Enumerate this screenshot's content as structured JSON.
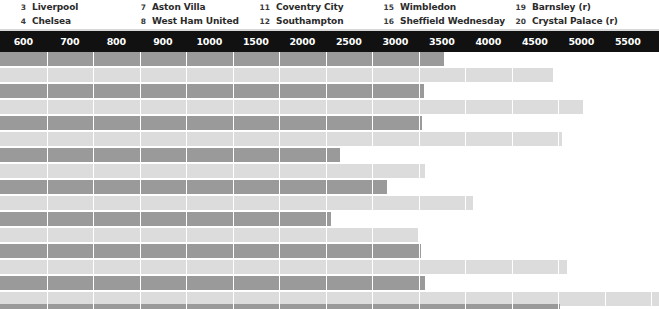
{
  "legend": {
    "columns": [
      {
        "left": 8,
        "entries": [
          {
            "num": "3",
            "name": "Liverpool"
          },
          {
            "num": "4",
            "name": "Chelsea"
          }
        ]
      },
      {
        "left": 128,
        "entries": [
          {
            "num": "7",
            "name": "Aston Villa"
          },
          {
            "num": "8",
            "name": "West Ham United"
          }
        ]
      },
      {
        "left": 252,
        "entries": [
          {
            "num": "11",
            "name": "Coventry City"
          },
          {
            "num": "12",
            "name": "Southampton"
          }
        ]
      },
      {
        "left": 376,
        "entries": [
          {
            "num": "15",
            "name": "Wimbledon"
          },
          {
            "num": "16",
            "name": "Sheffield Wednesday"
          }
        ]
      },
      {
        "left": 508,
        "entries": [
          {
            "num": "19",
            "name": "Barnsley (r)"
          },
          {
            "num": "20",
            "name": "Crystal Palace (r)"
          }
        ]
      }
    ]
  },
  "axis": {
    "ticks": [
      "600",
      "700",
      "800",
      "900",
      "1000",
      "1500",
      "2000",
      "2500",
      "3000",
      "3500",
      "4000",
      "4500",
      "5000",
      "5500",
      "6000",
      "6500",
      "7000"
    ],
    "tick_step_px": 46.5,
    "tick_origin_px": 0,
    "background_color": "#111111",
    "label_color": "#ffffff"
  },
  "colors": {
    "bar_dark": "#9a9a9a",
    "bar_light": "#dcdcdc",
    "gridline": "#ffffff",
    "page_background": "#ffffff",
    "legend_text": "#2b2b2b"
  },
  "chart_data": {
    "type": "bar",
    "orientation": "horizontal",
    "title": "",
    "xlabel": "",
    "ylabel": "",
    "grid": true,
    "legend_position": "top",
    "axis_tick_labels": [
      "600",
      "700",
      "800",
      "900",
      "1000",
      "1500",
      "2000",
      "2500",
      "3000",
      "3500",
      "4000",
      "4500",
      "5000",
      "5500",
      "6000",
      "6500",
      "7000"
    ],
    "axis_scale": "non-linear-banded",
    "series": [
      {
        "name": "dark",
        "color": "#9a9a9a"
      },
      {
        "name": "light",
        "color": "#dcdcdc"
      }
    ],
    "rows": [
      {
        "index": 1,
        "dark_px": 444,
        "light_px": 553,
        "dark_value": 4480,
        "light_value": 5870
      },
      {
        "index": 2,
        "dark_px": 424,
        "light_px": 583,
        "dark_value": 4270,
        "light_value": 6190
      },
      {
        "index": 3,
        "dark_px": 422,
        "light_px": 562,
        "dark_value": 4250,
        "light_value": 5970
      },
      {
        "index": 4,
        "dark_px": 340,
        "light_px": 425,
        "dark_value": 3370,
        "light_value": 4280
      },
      {
        "index": 5,
        "dark_px": 387,
        "light_px": 473,
        "dark_value": 3870,
        "light_value": 4790
      },
      {
        "index": 6,
        "dark_px": 331,
        "light_px": 418,
        "dark_value": 3280,
        "light_value": 4200
      },
      {
        "index": 7,
        "dark_px": 421,
        "light_px": 567,
        "dark_value": 4240,
        "light_value": 6020
      },
      {
        "index": 8,
        "dark_px": 425,
        "light_px": 659,
        "dark_value": 4280,
        "light_value": 7000
      },
      {
        "index": 9,
        "dark_px": 560,
        "light_px": 659,
        "dark_value": 5920,
        "light_value": 7000
      }
    ],
    "row_geometry": [
      {
        "top": 0,
        "dark_h": 14,
        "gap": 2,
        "light_h": 14,
        "pad": 2
      },
      {
        "top": 32,
        "dark_h": 14,
        "gap": 2,
        "light_h": 14,
        "pad": 2
      },
      {
        "top": 64,
        "dark_h": 14,
        "gap": 2,
        "light_h": 14,
        "pad": 2
      },
      {
        "top": 96,
        "dark_h": 14,
        "gap": 2,
        "light_h": 14,
        "pad": 2
      },
      {
        "top": 128,
        "dark_h": 14,
        "gap": 2,
        "light_h": 14,
        "pad": 2
      },
      {
        "top": 160,
        "dark_h": 14,
        "gap": 2,
        "light_h": 14,
        "pad": 2
      },
      {
        "top": 192,
        "dark_h": 14,
        "gap": 2,
        "light_h": 14,
        "pad": 2
      },
      {
        "top": 224,
        "dark_h": 14,
        "gap": 2,
        "light_h": 14,
        "pad": 2
      },
      {
        "top": 252,
        "dark_h": 5,
        "gap": 0,
        "light_h": 0,
        "pad": 0
      }
    ]
  }
}
